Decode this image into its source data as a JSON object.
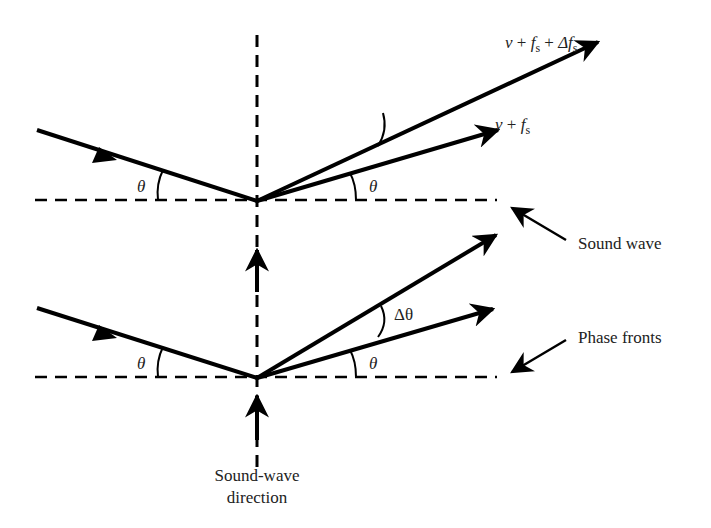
{
  "diagram": {
    "type": "acousto-optic diffraction (Bragg) geometry",
    "colors": {
      "line": "#000000",
      "text": "#222222",
      "background": "#ffffff"
    },
    "top_panel": {
      "incident_angle_label": "θ",
      "reflected_angle_label": "θ",
      "beam_labels": {
        "upper_beam": {
          "nu": "ν",
          "plus1": " + ",
          "f": "f",
          "f_sub": "s",
          "plus2": " + ",
          "delta_f": "Δf",
          "delta_f_sub": "s"
        },
        "lower_beam": {
          "nu": "ν",
          "plus1": " + ",
          "f": "f",
          "f_sub": "s"
        }
      }
    },
    "bottom_panel": {
      "incident_angle_label": "θ",
      "reflected_angle_label": "θ",
      "delta_angle_label": "Δθ"
    },
    "callouts": {
      "sound_wave": "Sound wave",
      "phase_fronts": "Phase fronts"
    },
    "direction_label": {
      "line1": "Sound-wave",
      "line2": "direction"
    }
  }
}
